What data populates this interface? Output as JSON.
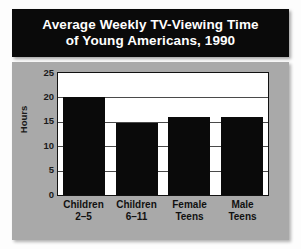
{
  "title": {
    "line1": "Average Weekly TV-Viewing Time",
    "line2": "of Young Americans, 1990"
  },
  "colors": {
    "banner_background": "#0a0a0a",
    "banner_text": "#ffffff",
    "panel_background": "#a9a9a9",
    "plot_background": "#ffffff",
    "bar_color": "#0a0a0a",
    "gridline": "#4a4a4a",
    "axis_text": "#111111"
  },
  "chart_data": {
    "type": "bar",
    "title": "Average Weekly TV-Viewing Time of Young Americans, 1990",
    "xlabel": "",
    "ylabel": "Hours",
    "categories": [
      "Children 2-5",
      "Children 6-11",
      "Female Teens",
      "Male Teens"
    ],
    "category_lines": [
      {
        "line1": "Children",
        "line2": "2–5"
      },
      {
        "line1": "Children",
        "line2": "6–11"
      },
      {
        "line1": "Female",
        "line2": "Teens"
      },
      {
        "line1": "Male",
        "line2": "Teens"
      }
    ],
    "values": [
      20,
      14.7,
      16,
      16
    ],
    "ylim": [
      0,
      25
    ],
    "yticks": [
      25,
      20,
      15,
      10,
      5,
      0
    ],
    "grid": true,
    "legend": "none"
  }
}
